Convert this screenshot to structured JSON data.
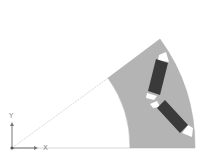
{
  "diagram": {
    "type": "rotor-sector-geometry",
    "axes": {
      "x_label": "X",
      "y_label": "Y"
    },
    "colors": {
      "background": "#ffffff",
      "rotor_core": "#b4b4b4",
      "magnet": "#3a3a3a",
      "flux_barrier": "#ffffff",
      "construction_line": "#cccccc",
      "axis": "#777777"
    },
    "elements": [
      {
        "name": "rotor-core-sector",
        "description": "Annular sector of rotor lamination"
      },
      {
        "name": "magnet-upper",
        "description": "Permanent magnet, upper leg of V"
      },
      {
        "name": "magnet-lower",
        "description": "Permanent magnet, lower leg of V"
      },
      {
        "name": "flux-barriers",
        "description": "Air pockets at magnet ends"
      }
    ]
  }
}
